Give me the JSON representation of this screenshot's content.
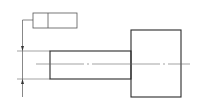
{
  "drawing": {
    "type": "engineering-drawing",
    "description": "Stepped shaft with geometric tolerance feature control frame",
    "colors": {
      "line": "#2a2a2a",
      "thin_line": "#555555",
      "background": "#ffffff"
    },
    "feature_control_frame": {
      "cell_1": "",
      "cell_2": ""
    }
  }
}
